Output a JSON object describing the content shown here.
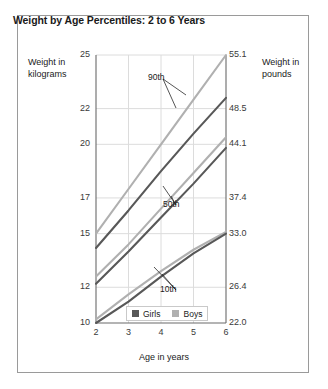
{
  "figure": {
    "title": "Weight by Age Percentiles: 2 to 6 Years",
    "left_axis_caption": "Weight in kilograms",
    "right_axis_caption": "Weight in pounds",
    "x_axis_caption": "Age in years"
  },
  "legend": {
    "items": [
      {
        "label": "Girls",
        "color": "#585858"
      },
      {
        "label": "Boys",
        "color": "#b0b0b0"
      }
    ]
  },
  "annotations": [
    {
      "label": "90th"
    },
    {
      "label": "50th"
    },
    {
      "label": "10th"
    }
  ],
  "chart_data": {
    "type": "line",
    "title": "Weight by Age Percentiles: 2 to 6 Years",
    "xlabel": "Age in years",
    "ylabel": "Weight in kilograms",
    "ylabel_secondary": "Weight in pounds",
    "xlim": [
      2,
      6
    ],
    "ylim": [
      10,
      25
    ],
    "grid": true,
    "legend_position": "bottom-center",
    "x": [
      2,
      3,
      4,
      5,
      6
    ],
    "xticks": [
      "2",
      "3",
      "4",
      "5",
      "6"
    ],
    "yticks_left": [
      "10",
      "12",
      "15",
      "17",
      "20",
      "22",
      "25"
    ],
    "yticks_left_values": [
      10,
      12,
      15,
      17,
      20,
      22,
      25
    ],
    "yticks_right": [
      "22.0",
      "26.4",
      "33.0",
      "37.4",
      "44.1",
      "48.5",
      "55.1"
    ],
    "yticks_right_values": [
      22.0,
      26.4,
      33.0,
      37.4,
      44.1,
      48.5,
      55.1
    ],
    "series": [
      {
        "name": "Boys 90th",
        "percentile": "90th",
        "group": "Boys",
        "color": "#b0b0b0",
        "values": [
          15.0,
          17.5,
          20.0,
          22.5,
          25.0
        ]
      },
      {
        "name": "Girls 90th",
        "percentile": "90th",
        "group": "Girls",
        "color": "#585858",
        "values": [
          14.2,
          16.3,
          18.5,
          20.6,
          22.6
        ]
      },
      {
        "name": "Boys 50th",
        "percentile": "50th",
        "group": "Boys",
        "color": "#b0b0b0",
        "values": [
          12.6,
          14.4,
          16.4,
          18.4,
          20.4
        ]
      },
      {
        "name": "Girls 50th",
        "percentile": "50th",
        "group": "Girls",
        "color": "#585858",
        "values": [
          12.2,
          14.0,
          15.9,
          17.8,
          19.8
        ]
      },
      {
        "name": "Boys 10th",
        "percentile": "10th",
        "group": "Boys",
        "color": "#b0b0b0",
        "values": [
          10.2,
          11.6,
          12.9,
          14.1,
          15.1
        ]
      },
      {
        "name": "Girls 10th",
        "percentile": "10th",
        "group": "Girls",
        "color": "#585858",
        "values": [
          10.0,
          11.2,
          12.6,
          13.9,
          15.0
        ]
      }
    ]
  }
}
